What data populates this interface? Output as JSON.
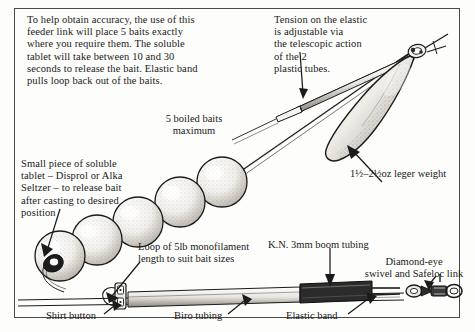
{
  "figure": {
    "title_hidden": "Bait feeder link rig diagram",
    "border_color": "#4a4a4a",
    "ink_color": "#1b1b1b",
    "paper_color": "#fdfdfb"
  },
  "annotations": {
    "intro_paragraph": "To help obtain accuracy, the use of this\nfeeder link will place 5 baits exactly\nwhere you require them. The soluble\ntablet will take between 10 and 30\nseconds to release the bait. Elastic band\npulls loop back out of the baits.",
    "tension_note": "Tension on the elastic\nis adjustable via\nthe telescopic action\nof the 2\nplastic tubes.",
    "baits_label": "5 boiled baits\nmaximum",
    "tablet_note": "Small piece of soluble\ntablet – Disprol or Alka\nSeltzer – to release bait\nafter casting to desired\nposition",
    "leger_weight_label": "1½–2½oz leger weight",
    "loop_label": "Loop of 5lb monofilament\nlength to suit bait sizes",
    "boom_tubing_label": "K.N. 3mm boom tubing",
    "swivel_label": "Diamond-eye\nswivel and Safeloc link",
    "shirt_button_label": "Shirt button",
    "biro_tubing_label": "Biro tubing",
    "elastic_band_label": "Elastic band"
  },
  "parts": {
    "bait_count": 5,
    "bait_name": "boiled bait",
    "tablet_name": "soluble tablet",
    "weight_name": "leger weight",
    "swivel_name": "diamond-eye swivel",
    "link_name": "Safeloc link",
    "tubing_name": "boom tubing",
    "button_name": "shirt button",
    "elastic_name": "elastic band"
  }
}
